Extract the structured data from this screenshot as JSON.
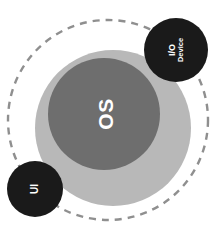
{
  "diagram": {
    "canvas": {
      "width": 213,
      "height": 241,
      "background": "#ffffff"
    },
    "boundary": {
      "name": "system-boundary",
      "style": "dashed-circle",
      "stroke_color": "#8f8f8f",
      "stroke_width": 2.4,
      "dash_pattern": "7 6",
      "cx": 108,
      "cy": 120,
      "r": 100
    },
    "nodes": [
      {
        "id": "outer-layer",
        "label": "",
        "shape": "circle",
        "fill": "#b8b8b8",
        "cx": 113,
        "cy": 128,
        "r": 78,
        "text_color": "#ffffff"
      },
      {
        "id": "os",
        "label": "OS",
        "shape": "circle",
        "fill": "#6e6e6e",
        "cx": 104,
        "cy": 114,
        "r": 56,
        "text_color": "#ffffff",
        "label_rotation": -90
      },
      {
        "id": "io-device",
        "label": "I/O Device",
        "label_lines": [
          "I/O",
          "Device"
        ],
        "shape": "circle",
        "fill": "#1a1a1a",
        "cx": 176,
        "cy": 50,
        "r": 32,
        "text_color": "#ffffff",
        "label_rotation": -90
      },
      {
        "id": "ui",
        "label": "UI",
        "shape": "circle",
        "fill": "#1a1a1a",
        "cx": 35,
        "cy": 189,
        "r": 28,
        "text_color": "#ffffff",
        "label_rotation": -90
      }
    ]
  }
}
